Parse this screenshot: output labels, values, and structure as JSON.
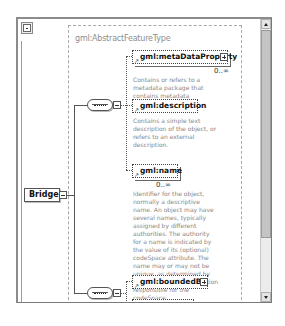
{
  "diagram": {
    "root_element": {
      "label": "Bridge",
      "expand_icon": "minus-box-icon"
    },
    "complex_type": {
      "label": "gml:AbstractFeatureType"
    },
    "children": [
      {
        "label": "gml:metaDataProperty",
        "multiplicity": "0..∞",
        "optional": true,
        "expandable": true,
        "documentation": "Contains or refers to a metadata package that contains metadata properties."
      },
      {
        "label": "gml:description",
        "optional": true,
        "expandable": false,
        "documentation": "Contains a simple text description of the object, or refers to an external description."
      },
      {
        "label": "gml:name",
        "multiplicity": "0..∞",
        "optional": true,
        "expandable": false,
        "documentation": "Identifier for the object, normally a descriptive name. An object may have several names, typically assigned by different authorities. The authority for a name is indicated by the value of its (optional) codeSpace attribute. The name may or may not be unique, as determined by the rules of the organization responsible for the codeSpace."
      },
      {
        "label": "gml:boundedBy",
        "optional": true,
        "expandable": true
      },
      {
        "label": "gml:location",
        "optional": true,
        "expandable": true
      }
    ],
    "compositors": [
      {
        "type": "sequence",
        "icon": "sequence-icon"
      },
      {
        "type": "sequence",
        "icon": "sequence-icon"
      }
    ]
  },
  "colors": {
    "line": "#555555",
    "frame_border": "#8c8c8c",
    "doc_text": "#888888",
    "scroll_thumb": "#c4c4c4"
  }
}
